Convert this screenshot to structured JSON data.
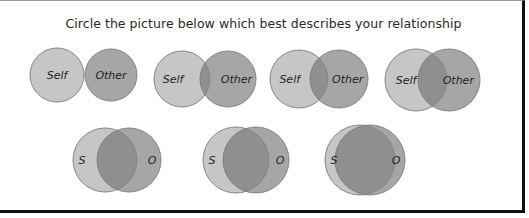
{
  "title": "Circle the picture below which best describes your relationship",
  "colors": {
    "self": "#c6c6c6",
    "other": "#a6a6a6",
    "overlap": "#8f8f8f",
    "stroke": "#8a8a8a",
    "text": "#1e1e1e"
  },
  "options": [
    {
      "id": 1,
      "self": {
        "cx": 57,
        "cy": 75,
        "r": 27,
        "label": "Self"
      },
      "other": {
        "cx": 111,
        "cy": 75,
        "r": 26,
        "label": "Other"
      }
    },
    {
      "id": 2,
      "self": {
        "cx": 182,
        "cy": 79,
        "r": 28,
        "label": "Self"
      },
      "other": {
        "cx": 228,
        "cy": 79,
        "r": 28,
        "label": "Other"
      }
    },
    {
      "id": 3,
      "self": {
        "cx": 299,
        "cy": 79,
        "r": 29,
        "label": "Self"
      },
      "other": {
        "cx": 339,
        "cy": 79,
        "r": 29,
        "label": "Other"
      }
    },
    {
      "id": 4,
      "self": {
        "cx": 416,
        "cy": 80,
        "r": 31,
        "label": "Self"
      },
      "other": {
        "cx": 449,
        "cy": 80,
        "r": 31,
        "label": "Other"
      }
    },
    {
      "id": 5,
      "self": {
        "cx": 105,
        "cy": 160,
        "r": 32,
        "label": "S"
      },
      "other": {
        "cx": 129,
        "cy": 160,
        "r": 32,
        "label": "O"
      }
    },
    {
      "id": 6,
      "self": {
        "cx": 236,
        "cy": 160,
        "r": 33,
        "label": "S"
      },
      "other": {
        "cx": 256,
        "cy": 160,
        "r": 33,
        "label": "O"
      }
    },
    {
      "id": 7,
      "self": {
        "cx": 360,
        "cy": 160,
        "r": 35,
        "label": "S"
      },
      "other": {
        "cx": 370,
        "cy": 160,
        "r": 35,
        "label": "O"
      }
    }
  ]
}
